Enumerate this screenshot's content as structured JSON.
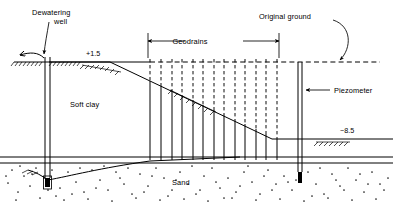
{
  "figure": {
    "width": 393,
    "height": 209,
    "background_color": "#ffffff",
    "line_color": "#000000"
  },
  "labels": {
    "dewatering_well": "Dewatering\nwell",
    "dewatering_well_line1": "Dewatering",
    "dewatering_well_line2": "well",
    "geodrains": "Geodrains",
    "original_ground": "Original ground",
    "piezometer": "Piezometer",
    "soft_clay": "Soft clay",
    "sand": "Sand",
    "elevation_top": "+1.5",
    "elevation_bottom": "−8.5"
  },
  "strata": [
    {
      "name": "soft-clay",
      "label": "Soft clay",
      "hatch": "none",
      "top_y": 62,
      "bottom_y": 157
    },
    {
      "name": "sand",
      "label": "Sand",
      "hatch": "stipple-dots",
      "top_y": 162,
      "bottom_y": 203
    }
  ],
  "elevations": [
    {
      "name": "upstream-water-level",
      "value": "+1.5",
      "x": 97,
      "y": 52
    },
    {
      "name": "downstream-water-level",
      "value": "−8.5",
      "x": 351,
      "y": 110
    }
  ],
  "features": [
    {
      "name": "dewatering-well",
      "label": "Dewatering well",
      "x": 47,
      "top_y": 57,
      "bottom_y": 184
    },
    {
      "name": "piezometer",
      "label": "Piezometer",
      "x": 300,
      "top_y": 62,
      "bottom_y": 180
    },
    {
      "name": "geodrain-group",
      "label": "Geodrains",
      "count": 13,
      "x_start": 150,
      "x_end": 278
    }
  ],
  "dimension": {
    "name": "geodrains-extent",
    "label": "Geodrains",
    "x_start": 148,
    "x_end": 279,
    "y": 41
  },
  "annotations": [
    {
      "name": "original-ground-leader",
      "label": "Original ground",
      "target_x": 337,
      "target_y": 68
    },
    {
      "name": "discharge-arrow",
      "label": "",
      "target_x": 18,
      "target_y": 56
    }
  ]
}
